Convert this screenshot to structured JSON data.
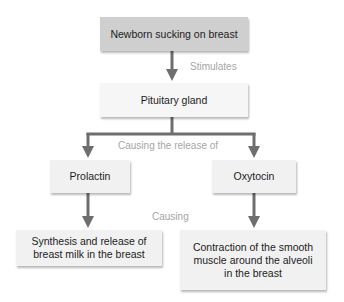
{
  "nodes": {
    "newborn": "Newborn sucking on breast",
    "pituitary": "Pituitary gland",
    "prolactin": "Prolactin",
    "oxytocin": "Oxytocin",
    "synthesis": "Synthesis and release of breast milk in the breast",
    "contraction": "Contraction of the smooth muscle around the alveoli in the breast"
  },
  "edge_labels": {
    "stimulates": "Stimulates",
    "causing_release": "Causing the release of",
    "causing": "Causing"
  },
  "colors": {
    "arrow": "#6e6e6e",
    "label": "#a6a6a6",
    "root_fill": "#cfcfcf",
    "node_fill": "#f1f1f1"
  }
}
